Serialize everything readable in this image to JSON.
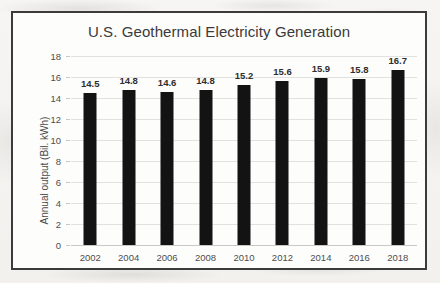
{
  "chart_data": {
    "type": "bar",
    "title": "U.S. Geothermal Electricity Generation",
    "xlabel": "",
    "ylabel": "Annual output (Bil. kWh)",
    "categories": [
      "2002",
      "2004",
      "2006",
      "2008",
      "2010",
      "2012",
      "2014",
      "2016",
      "2018"
    ],
    "values": [
      14.5,
      14.8,
      14.6,
      14.8,
      15.2,
      15.6,
      15.9,
      15.8,
      16.7
    ],
    "value_labels": [
      "14.5",
      "14.8",
      "14.6",
      "14.8",
      "15.2",
      "15.6",
      "15.9",
      "15.8",
      "16.7"
    ],
    "ylim": [
      0,
      18
    ],
    "ytick_values": [
      0,
      2,
      4,
      6,
      8,
      10,
      12,
      14,
      16,
      18
    ],
    "ytick_labels": [
      "0",
      "2",
      "4",
      "6",
      "8",
      "10",
      "12",
      "14",
      "16",
      "18"
    ],
    "grid": true,
    "legend": false,
    "bar_color": "#131313",
    "gridline_color": "#e2e1df",
    "frame_color": "#3b3b3b",
    "plot_background": "#fdfdfc"
  }
}
